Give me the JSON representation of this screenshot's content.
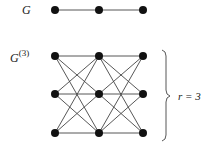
{
  "labels": {
    "graph": "G",
    "blowup_base": "G",
    "blowup_sup": "(3)",
    "r_label": "r = 3"
  },
  "graph_g": {
    "nodes": [
      [
        55,
        10
      ],
      [
        99,
        10
      ],
      [
        143,
        10
      ]
    ],
    "edges": [
      [
        0,
        1
      ],
      [
        1,
        2
      ]
    ]
  },
  "graph_g3": {
    "columns": [
      55,
      99,
      143
    ],
    "rows": [
      56,
      94,
      133
    ]
  },
  "colors": {
    "node": "#111111",
    "edge": "#444444"
  }
}
